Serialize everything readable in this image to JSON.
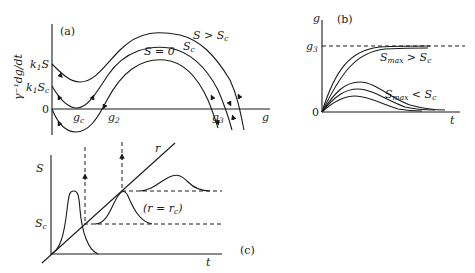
{
  "figure": {
    "panel_a": {
      "tag": "(a)",
      "y_axis_label": "γ⁻¹dg/dt",
      "x_axis_label": "g",
      "y_ticks": [
        "k₁S",
        "k₁Sc",
        "0"
      ],
      "x_points": [
        "gc",
        "g2",
        "g3"
      ],
      "curves": [
        "S > Sc",
        "Sc",
        "S = 0"
      ]
    },
    "panel_b": {
      "tag": "(b)",
      "y_axis_label": "g",
      "x_axis_label": "t",
      "origin": "0",
      "asymptote": "g3",
      "group_labels": [
        "Smax > Sc",
        "Smax < Sc"
      ]
    },
    "panel_c": {
      "tag": "(c)",
      "y_axis_label": "S",
      "x_axis_label": "t",
      "threshold": "Sc",
      "line_label": "r",
      "annotation": "(r = rc)"
    }
  }
}
